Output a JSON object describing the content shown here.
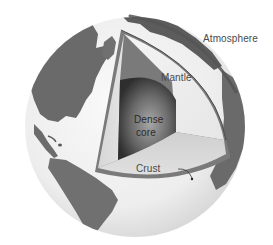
{
  "diagram": {
    "labels": {
      "atmosphere": "Atmosphere",
      "mantle": "Mantle",
      "core_line1": "Dense",
      "core_line2": "core",
      "crust": "Crust"
    },
    "layers": [
      {
        "name": "Atmosphere",
        "color": "#5a5a5a"
      },
      {
        "name": "Crust",
        "color": "#6e6e6e"
      },
      {
        "name": "Mantle",
        "color": "#ececec"
      },
      {
        "name": "Dense core",
        "color": "#3c3c3c"
      }
    ],
    "colors": {
      "ocean": "#f2f2f2",
      "land": "#6a6a6a",
      "background": "#ffffff"
    }
  }
}
